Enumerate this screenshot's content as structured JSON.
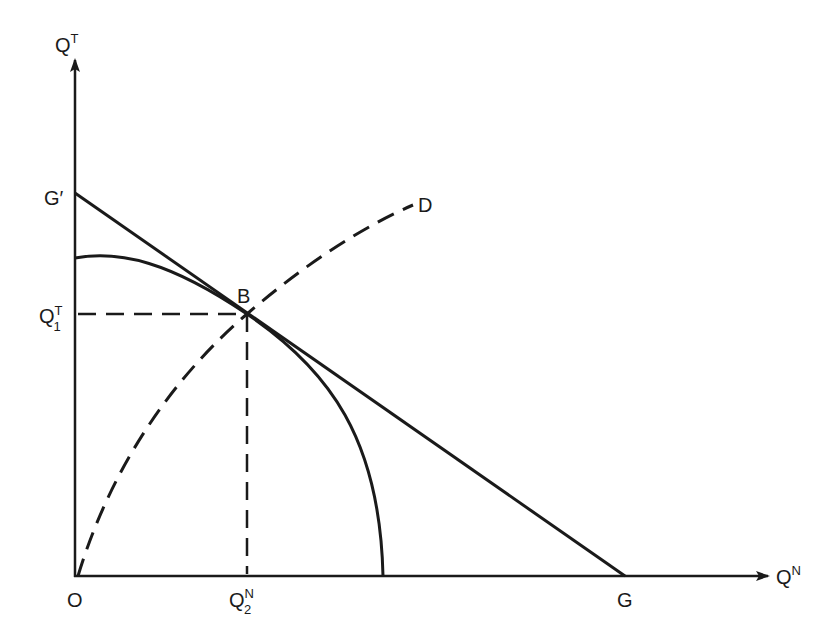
{
  "axes": {
    "y_label": "Q",
    "y_label_sup": "T",
    "x_label": "Q",
    "x_label_sup": "N",
    "origin_label": "O"
  },
  "points": {
    "g_prime": "G′",
    "g": "G",
    "b": "B",
    "d": "D"
  },
  "ticks": {
    "y_tick": "Q",
    "y_tick_sup": "T",
    "y_tick_sub": "1",
    "x_tick": "Q",
    "x_tick_sup": "N",
    "x_tick_sub": "2"
  },
  "colors": {
    "ink": "#1a1a1a",
    "background": "#ffffff"
  }
}
